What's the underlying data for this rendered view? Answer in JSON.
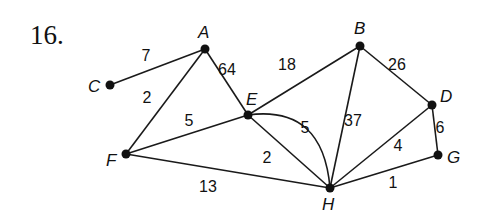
{
  "problem_number": "16.",
  "nodes": [
    {
      "id": "A",
      "label": "A",
      "x": 205,
      "y": 49,
      "lx": 198,
      "ly": 38
    },
    {
      "id": "B",
      "label": "B",
      "x": 360,
      "y": 46,
      "lx": 354,
      "ly": 34
    },
    {
      "id": "C",
      "label": "C",
      "x": 110,
      "y": 85,
      "lx": 88,
      "ly": 92
    },
    {
      "id": "D",
      "label": "D",
      "x": 432,
      "y": 105,
      "lx": 440,
      "ly": 102
    },
    {
      "id": "E",
      "label": "E",
      "x": 248,
      "y": 115,
      "lx": 246,
      "ly": 105
    },
    {
      "id": "F",
      "label": "F",
      "x": 126,
      "y": 154,
      "lx": 106,
      "ly": 166
    },
    {
      "id": "G",
      "label": "G",
      "x": 438,
      "y": 155,
      "lx": 447,
      "ly": 163
    },
    {
      "id": "H",
      "label": "H",
      "x": 330,
      "y": 188,
      "lx": 322,
      "ly": 210
    }
  ],
  "edges": [
    {
      "from": "C",
      "to": "A",
      "weight": "7",
      "wx": 146,
      "wy": 61
    },
    {
      "from": "A",
      "to": "F",
      "weight": "2",
      "wx": 147,
      "wy": 103
    },
    {
      "from": "A",
      "to": "E",
      "weight": "64",
      "wx": 227,
      "wy": 75
    },
    {
      "from": "E",
      "to": "B",
      "weight": "18",
      "wx": 287,
      "wy": 70
    },
    {
      "from": "B",
      "to": "D",
      "weight": "26",
      "wx": 397,
      "wy": 70
    },
    {
      "from": "B",
      "to": "H",
      "weight": "37",
      "wx": 353,
      "wy": 126
    },
    {
      "from": "D",
      "to": "G",
      "weight": "6",
      "wx": 440,
      "wy": 133
    },
    {
      "from": "D",
      "to": "H",
      "weight": "4",
      "wx": 398,
      "wy": 151
    },
    {
      "from": "G",
      "to": "H",
      "weight": "1",
      "wx": 393,
      "wy": 188
    },
    {
      "from": "F",
      "to": "E",
      "weight": "5",
      "wx": 189,
      "wy": 126
    },
    {
      "from": "E",
      "to": "H",
      "weight": "2",
      "wx": 267,
      "wy": 163
    },
    {
      "from": "E",
      "to": "H",
      "weight": "5",
      "curved": true,
      "wx": 305,
      "wy": 133
    },
    {
      "from": "F",
      "to": "H",
      "weight": "13",
      "wx": 208,
      "wy": 192
    }
  ]
}
